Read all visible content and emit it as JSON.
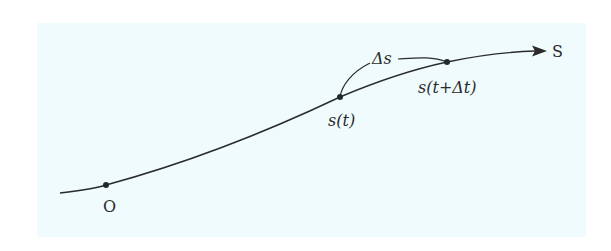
{
  "diagram": {
    "panel_color": "#effbfc",
    "curve_color": "#2b2b2b",
    "labels": {
      "origin": "O",
      "end": "S",
      "point_t": "s(t)",
      "point_t_dt": "s(t+Δt)",
      "delta_s": "Δs"
    },
    "points": [
      {
        "name": "O",
        "x": 106,
        "y": 185
      },
      {
        "name": "s(t)",
        "x": 340,
        "y": 97
      },
      {
        "name": "s(t+Δt)",
        "x": 447,
        "y": 62
      }
    ],
    "arrow_tip": {
      "x": 546,
      "y": 51
    }
  }
}
